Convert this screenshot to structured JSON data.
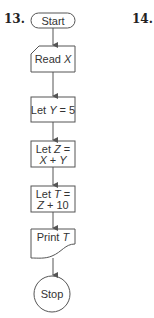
{
  "problems": [
    {
      "number": "13."
    },
    {
      "number": "14."
    }
  ],
  "flowchart": {
    "nodes": [
      {
        "id": "start",
        "shape": "terminal",
        "lines": [
          [
            "Start",
            ""
          ]
        ]
      },
      {
        "id": "read",
        "shape": "manual-input",
        "lines": [
          [
            "Read ",
            "X"
          ]
        ]
      },
      {
        "id": "let-y",
        "shape": "process",
        "lines": [
          [
            "Let ",
            "Y",
            " = 5"
          ]
        ]
      },
      {
        "id": "let-z",
        "shape": "process",
        "lines": [
          [
            "Let ",
            "Z",
            " ="
          ],
          [
            "",
            "X",
            " + ",
            "Y"
          ]
        ]
      },
      {
        "id": "let-t",
        "shape": "process",
        "lines": [
          [
            "Let ",
            "T",
            " ="
          ],
          [
            "",
            "Z",
            " + 10"
          ]
        ]
      },
      {
        "id": "print",
        "shape": "document",
        "lines": [
          [
            "Print ",
            "T"
          ]
        ]
      },
      {
        "id": "stop",
        "shape": "connector",
        "lines": [
          [
            "Stop"
          ]
        ]
      }
    ],
    "labels": {
      "start": "Start",
      "read_prefix": "Read ",
      "read_var": "X",
      "let_y_prefix": "Let ",
      "let_y_var": "Y",
      "let_y_suffix": " = 5",
      "let_z_prefix": "Let ",
      "let_z_var": "Z",
      "let_z_eq": " =",
      "let_z_x": "X",
      "let_z_plus": " + ",
      "let_z_y": "Y",
      "let_t_prefix": "Let ",
      "let_t_var": "T",
      "let_t_eq": " =",
      "let_t_z": "Z",
      "let_t_plus": " + 10",
      "print_prefix": "Print ",
      "print_var": "T",
      "stop": "Stop"
    },
    "colors": {
      "stroke": "#555555",
      "text": "#333333"
    }
  }
}
